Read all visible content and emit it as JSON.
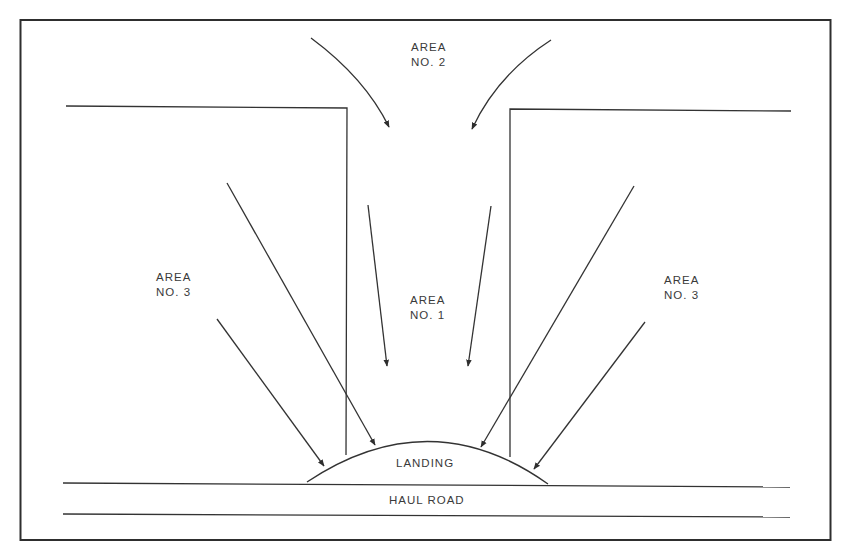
{
  "diagram": {
    "colors": {
      "line": "#333333",
      "text": "#3a3a3a",
      "background": "#ffffff"
    },
    "labels": {
      "area2": {
        "line1": "AREA",
        "line2": "NO. 2"
      },
      "area1": {
        "line1": "AREA",
        "line2": "NO. 1"
      },
      "area3_left": {
        "line1": "AREA",
        "line2": "NO. 3"
      },
      "area3_right": {
        "line1": "AREA",
        "line2": "NO. 3"
      },
      "landing": "LANDING",
      "haul_road": "HAUL ROAD"
    },
    "arrows": [
      {
        "name": "area2-left-arrow",
        "from_area": "AREA NO. 2",
        "to": "AREA NO. 1"
      },
      {
        "name": "area2-right-arrow",
        "from_area": "AREA NO. 2",
        "to": "AREA NO. 1"
      },
      {
        "name": "area1-left-arrow",
        "from_area": "AREA NO. 1",
        "to": "down"
      },
      {
        "name": "area1-right-arrow",
        "from_area": "AREA NO. 1",
        "to": "down"
      },
      {
        "name": "inner-left-arrow",
        "from_area": "AREA NO. 3 (left)",
        "to": "LANDING"
      },
      {
        "name": "inner-right-arrow",
        "from_area": "AREA NO. 3 (right)",
        "to": "LANDING"
      },
      {
        "name": "outer-left-arrow",
        "from_area": "AREA NO. 3 (left)",
        "to": "LANDING"
      },
      {
        "name": "outer-right-arrow",
        "from_area": "AREA NO. 3 (right)",
        "to": "LANDING"
      }
    ]
  }
}
